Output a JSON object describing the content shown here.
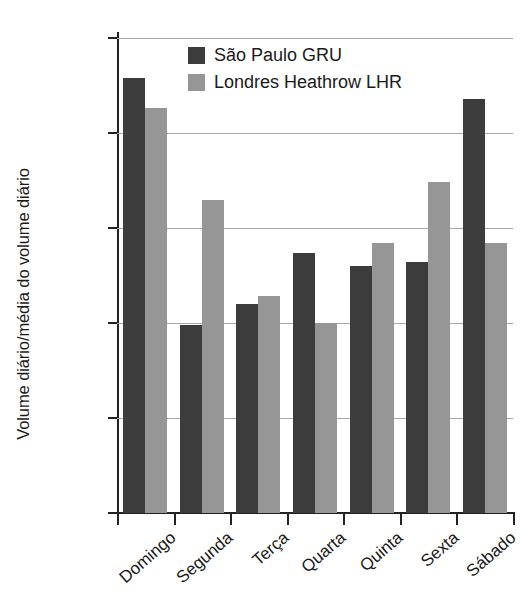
{
  "chart_data": {
    "type": "bar",
    "title": "",
    "xlabel": "",
    "ylabel": "Volume diário/média do volume diário",
    "categories": [
      "Domingo",
      "Segunda",
      "Terça",
      "Quarta",
      "Quinta",
      "Sexta",
      "Sábado"
    ],
    "series": [
      {
        "name": "São Paulo GRU",
        "color": "#3c3c3c",
        "values": [
          1.079,
          0.949,
          0.96,
          0.987,
          0.98,
          0.982,
          1.068
        ]
      },
      {
        "name": "Londres Heathrow LHR",
        "color": "#969696",
        "values": [
          1.063,
          1.015,
          0.964,
          0.95,
          0.992,
          1.024,
          0.992
        ]
      }
    ],
    "ylim": [
      0.85,
      1.1
    ],
    "yticks": [
      1.1,
      1.05,
      1.0,
      0.95,
      0.9,
      0.85
    ],
    "ytick_labels": [
      "1,1",
      "1,05",
      "1",
      "0,95",
      "0,9",
      "0,85"
    ],
    "grid": true,
    "legend_position": "top-center"
  },
  "legend": {
    "entries": [
      {
        "label": "São Paulo GRU",
        "color": "#3c3c3c"
      },
      {
        "label": "Londres Heathrow LHR",
        "color": "#969696"
      }
    ]
  }
}
